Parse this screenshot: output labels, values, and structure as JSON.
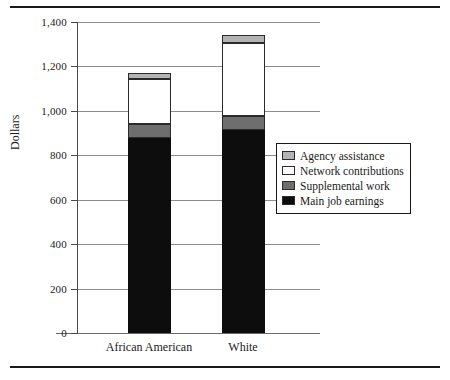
{
  "figure": {
    "background": "#ffffff",
    "rule_color": "#1a1a1a"
  },
  "axes": {
    "ylabel": "Dollars",
    "yticks": [
      0,
      200,
      400,
      600,
      800,
      1000,
      1200,
      1400
    ],
    "ytick_labels": [
      "0",
      "200",
      "400",
      "600",
      "800",
      "1,000",
      "1,200",
      "1,400"
    ],
    "ylim": [
      0,
      1400
    ],
    "grid": true,
    "xtick_labels": [
      "African American",
      "White"
    ]
  },
  "legend": {
    "position": "center-right",
    "entries": [
      {
        "label": "Agency assistance",
        "color": "#b3b3b3"
      },
      {
        "label": "Network contributions",
        "color": "#ffffff"
      },
      {
        "label": "Supplemental work",
        "color": "#6e6e6e"
      },
      {
        "label": "Main job earnings",
        "color": "#0d0d0d"
      }
    ]
  },
  "chart_data": {
    "type": "bar",
    "stacked": true,
    "title": "",
    "xlabel": "",
    "ylabel": "Dollars",
    "ylim": [
      0,
      1400
    ],
    "grid": true,
    "categories": [
      "African American",
      "White"
    ],
    "series": [
      {
        "name": "Main job earnings",
        "color": "#0d0d0d",
        "values": [
          880,
          915
        ]
      },
      {
        "name": "Supplemental work",
        "color": "#6e6e6e",
        "values": [
          60,
          60
        ]
      },
      {
        "name": "Network contributions",
        "color": "#ffffff",
        "values": [
          205,
          330
        ]
      },
      {
        "name": "Agency assistance",
        "color": "#b3b3b3",
        "values": [
          25,
          35
        ]
      }
    ],
    "totals": [
      1170,
      1340
    ]
  }
}
